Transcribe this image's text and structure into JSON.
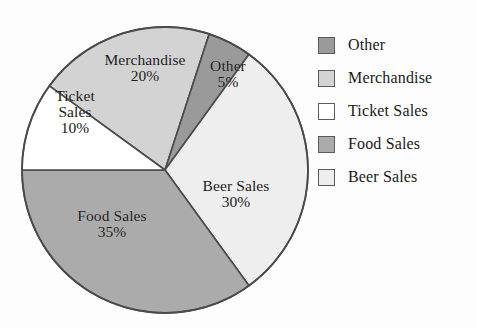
{
  "chart_data": {
    "type": "pie",
    "title": "",
    "subtitle": "",
    "xlabel": "",
    "ylabel": "",
    "legend_position": "right",
    "grid": false,
    "start_angle_deg": 18,
    "direction": "clockwise",
    "categories": [
      "Other",
      "Merchandise",
      "Ticket Sales",
      "Food Sales",
      "Beer Sales"
    ],
    "values": [
      5,
      20,
      10,
      35,
      30
    ],
    "units": "percent",
    "slices": [
      {
        "name": "Other",
        "value": 5,
        "value_label": "5%",
        "color": "#9a9a9a",
        "start_deg": 18,
        "end_deg": 36,
        "label_lines": [
          "Other",
          "5%"
        ]
      },
      {
        "name": "Beer Sales",
        "value": 30,
        "value_label": "30%",
        "color": "#eeeeee",
        "start_deg": 36,
        "end_deg": 144,
        "label_lines": [
          "Beer Sales",
          "30%"
        ]
      },
      {
        "name": "Food Sales",
        "value": 35,
        "value_label": "35%",
        "color": "#ababab",
        "start_deg": 144,
        "end_deg": 270,
        "label_lines": [
          "Food Sales",
          "35%"
        ]
      },
      {
        "name": "Ticket Sales",
        "value": 10,
        "value_label": "10%",
        "color": "#ffffff",
        "start_deg": 270,
        "end_deg": 306,
        "label_lines": [
          "Ticket",
          "Sales",
          "10%"
        ]
      },
      {
        "name": "Merchandise",
        "value": 20,
        "value_label": "20%",
        "color": "#d3d3d3",
        "start_deg": 306,
        "end_deg": 378,
        "label_lines": [
          "Merchandise",
          "20%"
        ]
      }
    ],
    "legend": [
      {
        "label": "Other",
        "color": "#9a9a9a"
      },
      {
        "label": "Merchandise",
        "color": "#d3d3d3"
      },
      {
        "label": "Ticket Sales",
        "color": "#ffffff"
      },
      {
        "label": "Food Sales",
        "color": "#ababab"
      },
      {
        "label": "Beer Sales",
        "color": "#eeeeee"
      }
    ]
  },
  "labels": {
    "merchandise": {
      "name": "Merchandise",
      "value": "20%"
    },
    "other": {
      "name": "Other",
      "value": "5%"
    },
    "ticket": {
      "name_line1": "Ticket",
      "name_line2": "Sales",
      "value": "10%"
    },
    "food": {
      "name": "Food Sales",
      "value": "35%"
    },
    "beer": {
      "name": "Beer Sales",
      "value": "30%"
    }
  },
  "colors": {
    "outline": "#4a4a4a",
    "text": "#1a1a1a",
    "background": "#fdfdfd"
  }
}
